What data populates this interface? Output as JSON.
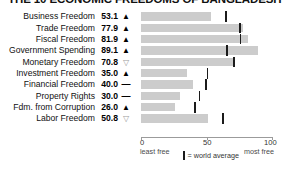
{
  "title": "THE 10 ECONOMIC FREEDOMS OF BANGLADESH",
  "chart_data": {
    "type": "bar",
    "title": "THE 10 ECONOMIC FREEDOMS",
    "xlabel": "",
    "ylabel": "",
    "xlim": [
      0,
      100
    ],
    "ticks": [
      {
        "value": 0,
        "label": "0"
      },
      {
        "value": 50,
        "label": "50"
      },
      {
        "value": 100,
        "label": "100"
      }
    ],
    "axis_end_labels": {
      "left": "least free",
      "right": "most free"
    },
    "legend": {
      "symbol": "|",
      "text": "= world average"
    },
    "grid": false,
    "categories": [
      "Business Freedom",
      "Trade Freedom",
      "Fiscal Freedom",
      "Government Spending",
      "Monetary Freedom",
      "Investment Freedom",
      "Financial Freedom",
      "Property Rights",
      "Fdm. from Corruption",
      "Labor Freedom"
    ],
    "values": [
      53.1,
      77.9,
      81.9,
      89.1,
      70.8,
      35.0,
      40.0,
      30.0,
      26.0,
      50.8
    ],
    "world_average": [
      64.3,
      74.8,
      75.4,
      65.0,
      70.4,
      50.0,
      49.0,
      44.0,
      40.5,
      62.1
    ],
    "trend": [
      "up",
      "up",
      "up",
      "up",
      "down",
      "up",
      "flat",
      "flat",
      "up",
      "down"
    ],
    "colors": {
      "bar": "#cccccc",
      "average_marker": "#1b1b1b",
      "axis": "#9b9b9b"
    }
  },
  "rows": [
    {
      "label": "Business Freedom",
      "value": "53.1",
      "trend": "up",
      "glyph": "▲",
      "bar": 53.1,
      "avg": 64.3
    },
    {
      "label": "Trade Freedom",
      "value": "77.9",
      "trend": "up",
      "glyph": "▲",
      "bar": 77.9,
      "avg": 74.8
    },
    {
      "label": "Fiscal Freedom",
      "value": "81.9",
      "trend": "up",
      "glyph": "▲",
      "bar": 81.9,
      "avg": 75.4
    },
    {
      "label": "Government Spending",
      "value": "89.1",
      "trend": "up",
      "glyph": "▲",
      "bar": 89.1,
      "avg": 65.0
    },
    {
      "label": "Monetary Freedom",
      "value": "70.8",
      "trend": "down",
      "glyph": "▽",
      "bar": 70.8,
      "avg": 70.4
    },
    {
      "label": "Investment Freedom",
      "value": "35.0",
      "trend": "up",
      "glyph": "▲",
      "bar": 35.0,
      "avg": 50.0
    },
    {
      "label": "Financial Freedom",
      "value": "40.0",
      "trend": "flat",
      "glyph": "—",
      "bar": 40.0,
      "avg": 49.0
    },
    {
      "label": "Property Rights",
      "value": "30.0",
      "trend": "flat",
      "glyph": "—",
      "bar": 30.0,
      "avg": 44.0
    },
    {
      "label": "Fdm. from Corruption",
      "value": "26.0",
      "trend": "up",
      "glyph": "▲",
      "bar": 26.0,
      "avg": 40.5
    },
    {
      "label": "Labor Freedom",
      "value": "50.8",
      "trend": "down",
      "glyph": "▽",
      "bar": 50.8,
      "avg": 62.1
    }
  ],
  "axis": {
    "tick0": "0",
    "tick50": "50",
    "tick100": "100",
    "least_free": "least free",
    "most_free": "most free"
  },
  "legend": {
    "symbol": "|",
    "text": "= world average"
  }
}
